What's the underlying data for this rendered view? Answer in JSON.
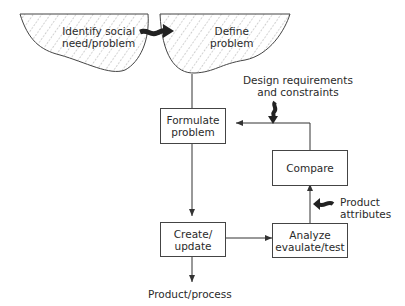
{
  "diagram": {
    "clouds": {
      "identify": "Identify social\nneed/problem",
      "define": "Define\nproblem"
    },
    "boxes": {
      "formulate": "Formulate\nproblem",
      "compare": "Compare",
      "create": "Create/\nupdate",
      "analyze": "Analyze\nevaulate/test"
    },
    "labels": {
      "design_req": "Design requirements\nand constraints",
      "product_attr": "Product\nattributes",
      "output": "Product/process"
    }
  }
}
